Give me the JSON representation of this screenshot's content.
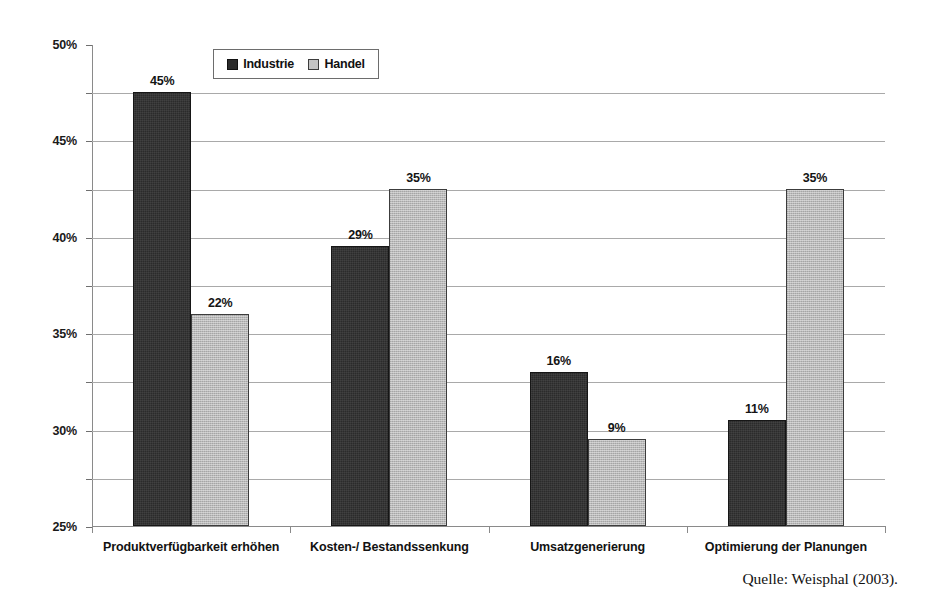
{
  "chart_data": {
    "type": "bar",
    "title": "",
    "subtitle": "",
    "xlabel": "",
    "ylabel": "",
    "ylim": [
      0,
      50
    ],
    "ytick_step": 5,
    "ytick_labels": [
      "0%",
      "5%",
      "10%",
      "15%",
      "20%",
      "25%",
      "30%",
      "35%",
      "40%",
      "45%",
      "50%"
    ],
    "grid": true,
    "value_suffix": "%",
    "legend_position": "top-center",
    "categories": [
      "Produktverfügbarkeit erhöhen",
      "Kosten-/ Bestandssenkung",
      "Umsatzgenerierung",
      "Optimierung der Planungen"
    ],
    "series": [
      {
        "name": "Industrie",
        "color": "#2b2b2b",
        "values": [
          45,
          29,
          16,
          11
        ],
        "labels": [
          "45%",
          "29%",
          "16%",
          "11%"
        ]
      },
      {
        "name": "Handel",
        "color": "#b9b9b9",
        "values": [
          22,
          35,
          9,
          35
        ],
        "labels": [
          "22%",
          "35%",
          "9%",
          "35%"
        ]
      }
    ],
    "annotations": [
      "Quelle: Weisphal (2003)."
    ]
  },
  "legend": {
    "items": [
      {
        "label": "Industrie",
        "swatch": "dark-square-icon"
      },
      {
        "label": "Handel",
        "swatch": "light-square-icon"
      }
    ]
  },
  "source": {
    "text": "Quelle: Weisphal (2003)."
  },
  "colors": {
    "series_industrie": "#2b2b2b",
    "series_handel": "#b9b9b9",
    "gridline": "#a9a9a9",
    "axis": "#8a8a8a",
    "background": "#ffffff",
    "text": "#111111"
  }
}
